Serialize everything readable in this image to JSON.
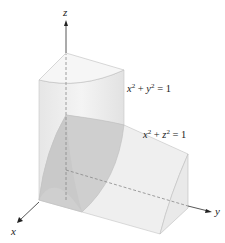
{
  "figure": {
    "axes": {
      "x": "x",
      "y": "y",
      "z": "z"
    },
    "equations": [
      {
        "var1": "x",
        "var2": "y",
        "exp": "2",
        "rhs": "1",
        "text": "x² + y² = 1"
      },
      {
        "var1": "x",
        "var2": "z",
        "exp": "2",
        "rhs": "1",
        "text": "x² + z² = 1"
      }
    ],
    "colors": {
      "surface_light": "#ececec",
      "surface_mid": "#dedede",
      "surface_dark": "#c4c4c4",
      "edge": "#bdbdbd",
      "axis": "#333333"
    }
  }
}
